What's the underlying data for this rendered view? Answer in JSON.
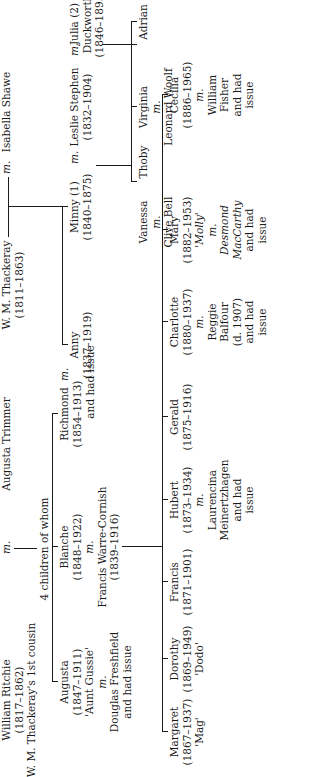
{
  "marriage_marker": "m.",
  "generation1": {
    "william_ritchie": {
      "name": "William Ritchie",
      "dates": "(1817–1862)",
      "note": "W. M. Thackeray's 1st cousin"
    },
    "augusta_trimmer": {
      "name": "Augusta Trimmer"
    },
    "wm_thackeray": {
      "name": "W. M. Thackeray",
      "dates": "(1811–1863)"
    },
    "isabella_shawe": {
      "name": "Isabella Shawe"
    }
  },
  "ritchie_children_note": "4 children of whom",
  "generation2": {
    "augusta": {
      "name": "Augusta",
      "dates": "(1847–1911)",
      "nickname": "'Aunt Gussie'",
      "spouse": "Douglas Freshfield",
      "issue": "and had issue"
    },
    "blanche": {
      "name": "Blanche",
      "dates": "(1848–1922)",
      "spouse": "Francis Warre-Cornish",
      "spouse_dates": "(1839–1916)"
    },
    "richmond": {
      "name": "Richmond",
      "dates": "(1854–1913)"
    },
    "anny": {
      "name": "Anny",
      "dates": "(1837–1919)"
    },
    "richmond_anny_issue": "and had issue",
    "minny": {
      "name": "Minny (1)",
      "dates": "(1840–1875)"
    },
    "leslie_stephen": {
      "name": "Leslie Stephen",
      "dates": "(1832–1904)"
    },
    "julia": {
      "name": "Julia (2)",
      "surname": "Duckworth",
      "dates": "(1846–1895)"
    }
  },
  "generation3_cornish": [
    {
      "name": "Margaret",
      "dates": "(1867–1937)",
      "extra": [
        "'Mag'"
      ]
    },
    {
      "name": "Dorothy",
      "dates": "(1869–1949)",
      "extra": [
        "'Dodo'"
      ]
    },
    {
      "name": "Francis",
      "dates": "(1871–1901)",
      "extra": []
    },
    {
      "name": "Hubert",
      "dates": "(1873–1934)",
      "extra": [
        "m.",
        "Laurencina",
        "Meinertzhagen",
        "and had",
        "issue"
      ]
    },
    {
      "name": "Gerald",
      "dates": "(1875–1916)",
      "extra": []
    },
    {
      "name": "Charlotte",
      "dates": "(1880–1937)",
      "extra": [
        "m.",
        "Reggie",
        "Balfour",
        "(d. 1907)",
        "and had",
        "issue"
      ]
    },
    {
      "name": "Mary",
      "dates": "(1882–1953)",
      "extra": [
        "'Molly'",
        "m.",
        "Desmond",
        "MacCarthy",
        "and had",
        "issue"
      ]
    },
    {
      "name": "Cecilia",
      "dates": "(1886–1965)",
      "extra": [
        "m.",
        "William",
        "Fisher",
        "and had",
        "issue"
      ]
    }
  ],
  "generation3_stephen": [
    {
      "name": "Vanessa",
      "extra": [
        "m.",
        "Clive Bell"
      ]
    },
    {
      "name": "Thoby",
      "extra": []
    },
    {
      "name": "Virginia",
      "extra": [
        "m.",
        "Leonard Woolf"
      ]
    },
    {
      "name": "Adrian",
      "extra": []
    }
  ]
}
